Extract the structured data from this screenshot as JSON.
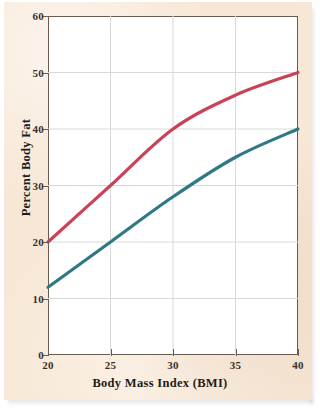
{
  "figure": {
    "background_color": "#f7e7d6",
    "plot_background_color": "#ffffff",
    "frame_color": "#6b5a4e",
    "grid_color": "#d9d9d9"
  },
  "chart_data": {
    "type": "line",
    "title": "",
    "xlabel": "Body Mass Index (BMI)",
    "ylabel": "Percent Body Fat",
    "xlim": [
      20,
      40
    ],
    "ylim": [
      0,
      60
    ],
    "xticks": [
      20,
      25,
      30,
      35,
      40
    ],
    "yticks": [
      0,
      10,
      20,
      30,
      40,
      50,
      60
    ],
    "xtick_labels": [
      "20",
      "25",
      "30",
      "35",
      "40"
    ],
    "ytick_labels": [
      "0",
      "10",
      "20",
      "30",
      "40",
      "50",
      "60"
    ],
    "grid": true,
    "legend": "none",
    "x": [
      20,
      25,
      30,
      35,
      40
    ],
    "series": [
      {
        "name": "upper-curve",
        "color": "#ca4257",
        "values": [
          20,
          30,
          40,
          46,
          50
        ]
      },
      {
        "name": "lower-curve",
        "color": "#2e7984",
        "values": [
          12,
          20,
          28,
          35,
          40
        ]
      }
    ]
  }
}
